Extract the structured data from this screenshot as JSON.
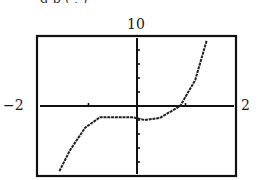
{
  "header": {
    "clipped_text": "g p        (     ,     )"
  },
  "chart_data": {
    "type": "line",
    "title": "",
    "xlabel": "",
    "ylabel": "",
    "xlim": [
      -2,
      2
    ],
    "ylim": [
      -10,
      10
    ],
    "grid": false,
    "legend": null,
    "axis_labels": {
      "xmin": "−2",
      "xmax": "2",
      "ymax": "10"
    },
    "x_ticks": [
      -1,
      1
    ],
    "y_ticks": [
      -8,
      -6,
      -4,
      -2,
      2,
      4,
      6,
      8
    ],
    "series": [
      {
        "name": "f(x)",
        "x": [
          -1.6,
          -1.38,
          -1.07,
          -0.76,
          -0.1,
          0.16,
          0.47,
          0.89,
          1.2,
          1.44
        ],
        "y": [
          -9.3,
          -6.3,
          -3.1,
          -1.6,
          -1.6,
          -2.0,
          -1.7,
          0.0,
          3.7,
          9.4
        ]
      }
    ],
    "colors": {
      "frame": "#111111",
      "axis": "#111111",
      "curve": "#222222"
    }
  }
}
